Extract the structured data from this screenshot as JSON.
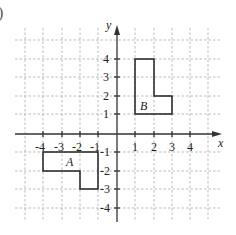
{
  "diagram": {
    "part_label": ")",
    "axes": {
      "x_label": "x",
      "y_label": "y",
      "x_ticks": [
        "-4",
        "-3",
        "-2",
        "-1",
        "1",
        "2",
        "3",
        "4"
      ],
      "y_ticks": [
        "4",
        "3",
        "2",
        "1",
        "-1",
        "-2",
        "-3",
        "-4"
      ]
    },
    "shapes": [
      {
        "name": "A",
        "vertices": [
          [
            -4,
            -1
          ],
          [
            -1,
            -1
          ],
          [
            -1,
            -3
          ],
          [
            -2,
            -3
          ],
          [
            -2,
            -2
          ],
          [
            -4,
            -2
          ]
        ]
      },
      {
        "name": "B",
        "vertices": [
          [
            1,
            1
          ],
          [
            3,
            1
          ],
          [
            3,
            2
          ],
          [
            2,
            2
          ],
          [
            2,
            4
          ],
          [
            1,
            4
          ]
        ]
      }
    ]
  }
}
